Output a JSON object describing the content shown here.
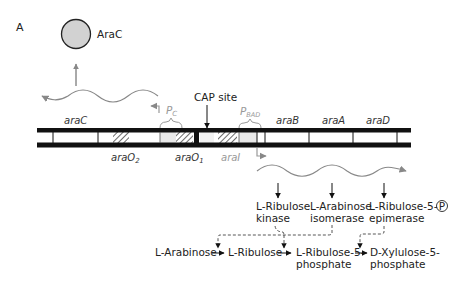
{
  "figure": {
    "panel_label": "A",
    "protein": {
      "label": "AraC",
      "fill": "#d2d2d2"
    },
    "cap_site_label": "CAP site",
    "promoters": {
      "pc": {
        "main": "P",
        "sub": "C"
      },
      "pbad": {
        "main": "P",
        "sub": "BAD"
      }
    },
    "genes": {
      "araC": "araC",
      "araB": "araB",
      "araA": "araA",
      "araD": "araD"
    },
    "operators": {
      "araO2": {
        "main": "araO",
        "sub": "2"
      },
      "araO1": {
        "main": "araO",
        "sub": "1"
      },
      "araI": "araI"
    },
    "enzymes": [
      {
        "line1": "L-Ribulose",
        "line2": "kinase"
      },
      {
        "line1": "L-Arabinose",
        "line2": "isomerase"
      },
      {
        "line1": "L-Ribulose-5-",
        "line1_circle": "P",
        "line2": "epimerase"
      }
    ],
    "pathway": [
      {
        "line1": "L-Arabinose",
        "line2": ""
      },
      {
        "line1": "L-Ribulose",
        "line2": ""
      },
      {
        "line1": "L-Ribulose-5-",
        "line2": "phosphate"
      },
      {
        "line1": "D-Xylulose-5-",
        "line2": "phosphate"
      }
    ],
    "colors": {
      "dna": "#111111",
      "mrna": "#888888",
      "promoter": "#999999",
      "hatch": "#444444"
    }
  }
}
